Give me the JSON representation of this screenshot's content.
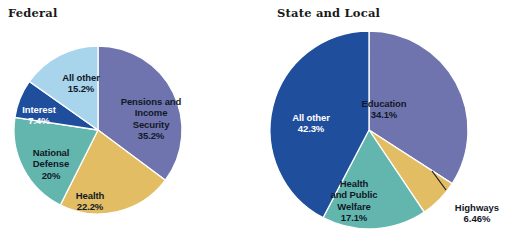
{
  "figure": {
    "background": "#ffffff",
    "width": 514,
    "height": 246
  },
  "panels": {
    "federal": {
      "title": "Federal"
    },
    "state": {
      "title": "State and Local"
    }
  },
  "palette": {
    "slate_purple": "#6f74ae",
    "gold": "#e2bd63",
    "teal": "#63b6ae",
    "dark_blue": "#1f4e9c",
    "light_blue": "#a9d5ec",
    "navy": "#24509e",
    "outline": "#ffffff"
  },
  "chart_data": [
    {
      "type": "pie",
      "title": "Federal",
      "legend": "none",
      "start_angle": 0,
      "direction": "clockwise",
      "center": [
        98,
        130
      ],
      "radius": 84,
      "categories": [
        "Pensions and Income Security",
        "Health",
        "National Defense",
        "Interest",
        "All other"
      ],
      "values": [
        35.2,
        22.2,
        20,
        7.4,
        15.2
      ],
      "value_labels": [
        "35.2%",
        "22.2%",
        "20%",
        "7.4%",
        "15.2%"
      ],
      "colors": [
        "#6f74ae",
        "#e2bd63",
        "#63b6ae",
        "#1f4e9c",
        "#a9d5ec"
      ],
      "slices": [
        {
          "name": "Pensions and Income Security",
          "label_lines": "Pensions and\nIncome\nSecurity",
          "value_label": "35.2%",
          "value": 35.2,
          "color": "#6f74ae"
        },
        {
          "name": "Health",
          "label_lines": "Health",
          "value_label": "22.2%",
          "value": 22.2,
          "color": "#e2bd63"
        },
        {
          "name": "National Defense",
          "label_lines": "National\nDefense",
          "value_label": "20%",
          "value": 20,
          "color": "#63b6ae"
        },
        {
          "name": "Interest",
          "label_lines": "Interest",
          "value_label": "7.4%",
          "value": 7.4,
          "color": "#1f4e9c"
        },
        {
          "name": "All other",
          "label_lines": "All other",
          "value_label": "15.2%",
          "value": 15.2,
          "color": "#a9d5ec"
        }
      ]
    },
    {
      "type": "pie",
      "title": "State and Local",
      "legend": "none",
      "start_angle": 0,
      "direction": "clockwise",
      "center": [
        369,
        130
      ],
      "radius": 99,
      "categories": [
        "Education",
        "Highways",
        "Health and Public Welfare",
        "All other"
      ],
      "values": [
        34.1,
        6.46,
        17.1,
        42.3
      ],
      "value_labels": [
        "34.1%",
        "6.46%",
        "17.1%",
        "42.3%"
      ],
      "colors": [
        "#6f74ae",
        "#e2bd63",
        "#63b6ae",
        "#1f4e9c"
      ],
      "slices": [
        {
          "name": "Education",
          "label_lines": "Education",
          "value_label": "34.1%",
          "value": 34.1,
          "color": "#6f74ae"
        },
        {
          "name": "Highways",
          "label_lines": "Highways",
          "value_label": "6.46%",
          "value": 6.46,
          "color": "#e2bd63",
          "callout": true
        },
        {
          "name": "Health and Public Welfare",
          "label_lines": "Health\nand Public\nWelfare",
          "value_label": "17.1%",
          "value": 17.1,
          "color": "#63b6ae"
        },
        {
          "name": "All other",
          "label_lines": "All other",
          "value_label": "42.3%",
          "value": 42.3,
          "color": "#1f4e9c"
        }
      ]
    }
  ]
}
